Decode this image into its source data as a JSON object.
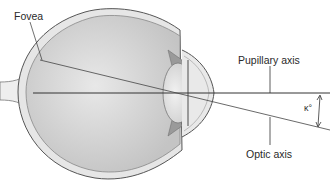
{
  "diagram": {
    "type": "eye cross-section",
    "labels": {
      "fovea": "Fovea",
      "pupillary_axis": "Pupillary axis",
      "optic_axis": "Optic axis",
      "angle": "κ°"
    },
    "colors": {
      "line": "#333333",
      "globe_fill": "#d4d4d4",
      "sclera": "#bdbdbd"
    }
  }
}
